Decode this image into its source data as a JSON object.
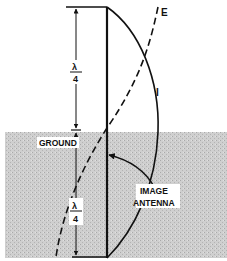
{
  "figure": {
    "type": "antenna-image-diagram",
    "labels": {
      "e_curve": "E",
      "i_curve": "I",
      "ground": "GROUND",
      "image_antenna_line1": "IMAGE",
      "image_antenna_line2": "ANTENNA",
      "upper_dimension_numerator": "λ",
      "upper_dimension_denominator": "4",
      "lower_dimension_numerator": "λ",
      "lower_dimension_denominator": "4"
    },
    "colors": {
      "ink": "#111111",
      "ground_fill": "#c9c9c9",
      "background": "#ffffff"
    }
  }
}
